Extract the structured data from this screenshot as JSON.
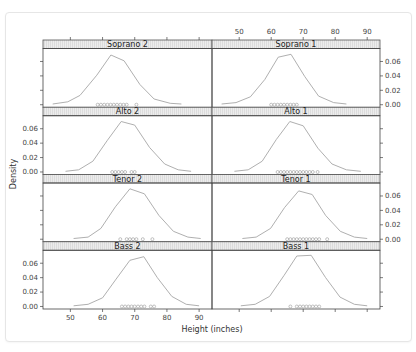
{
  "chart_data": {
    "type": "line",
    "subtype": "density-with-rug (lattice densityplot)",
    "title": "",
    "xlabel": "Height (inches)",
    "ylabel": "Density",
    "xlim": [
      41.5,
      94
    ],
    "ylim": [
      -0.0035,
      0.078
    ],
    "x_ticks": [
      50,
      60,
      70,
      80,
      90
    ],
    "y_ticks": [
      0.0,
      0.02,
      0.04,
      0.06
    ],
    "y_tick_labels": [
      "0.00",
      "0.02",
      "0.04",
      "0.06"
    ],
    "grid": false,
    "layout": {
      "columns": 2,
      "rows": 4
    },
    "panels": [
      {
        "name": "Soprano 2",
        "row": 0,
        "col": 0,
        "x": [
          44.5,
          49.2,
          53.0,
          58.2,
          62.6,
          66.7,
          71.6,
          76.0,
          81.0,
          84.5
        ],
        "y": [
          0.001,
          0.004,
          0.013,
          0.041,
          0.069,
          0.061,
          0.028,
          0.008,
          0.002,
          0.001
        ],
        "rug": [
          58.5,
          59.5,
          60.5,
          61.5,
          62.5,
          63.5,
          64.5,
          65.5,
          66.5,
          67.5,
          70.5
        ]
      },
      {
        "name": "Soprano 1",
        "row": 0,
        "col": 1,
        "x": [
          44.5,
          49.0,
          53.5,
          58.0,
          62.2,
          66.2,
          70.5,
          74.8,
          79.5,
          83.5
        ],
        "y": [
          0.001,
          0.003,
          0.011,
          0.035,
          0.066,
          0.07,
          0.039,
          0.012,
          0.003,
          0.001
        ],
        "rug": [
          60,
          61,
          62,
          63,
          64,
          65,
          66,
          67,
          68
        ]
      },
      {
        "name": "Alto 2",
        "row": 1,
        "col": 0,
        "x": [
          48.5,
          52.6,
          57.0,
          61.5,
          65.8,
          70.0,
          74.6,
          79.3,
          83.5,
          87.5
        ],
        "y": [
          0.001,
          0.003,
          0.015,
          0.044,
          0.07,
          0.065,
          0.034,
          0.011,
          0.003,
          0.001
        ],
        "rug": [
          63,
          64,
          65,
          66,
          67,
          69,
          70
        ]
      },
      {
        "name": "Alto 1",
        "row": 1,
        "col": 1,
        "x": [
          48.5,
          52.8,
          57.2,
          61.6,
          65.8,
          70.0,
          74.6,
          79.0,
          83.5,
          88.0
        ],
        "y": [
          0.001,
          0.003,
          0.015,
          0.045,
          0.07,
          0.064,
          0.033,
          0.011,
          0.003,
          0.001
        ],
        "rug": [
          62,
          63,
          64,
          65,
          66,
          67,
          68,
          69,
          70,
          71,
          72,
          73,
          74.5
        ]
      },
      {
        "name": "Tenor 2",
        "row": 2,
        "col": 0,
        "x": [
          51.0,
          55.5,
          59.5,
          64.0,
          68.5,
          73.0,
          77.5,
          82.0,
          86.5,
          90.5
        ],
        "y": [
          0.001,
          0.003,
          0.015,
          0.045,
          0.07,
          0.063,
          0.033,
          0.011,
          0.003,
          0.001
        ],
        "rug": [
          65.5,
          67.5,
          68.5,
          69.5,
          70.5,
          72.5,
          75.5
        ]
      },
      {
        "name": "Tenor 1",
        "row": 2,
        "col": 1,
        "x": [
          51.0,
          55.3,
          59.8,
          64.2,
          68.6,
          72.8,
          77.0,
          81.6,
          86.0,
          90.0
        ],
        "y": [
          0.001,
          0.003,
          0.015,
          0.044,
          0.067,
          0.062,
          0.033,
          0.011,
          0.003,
          0.001
        ],
        "rug": [
          65,
          66,
          67,
          68,
          69,
          70,
          71,
          72,
          73,
          74,
          75,
          77.5
        ]
      },
      {
        "name": "Bass 2",
        "row": 3,
        "col": 0,
        "x": [
          51.0,
          55.5,
          60.0,
          64.2,
          68.5,
          72.8,
          77.0,
          81.5,
          86.0,
          90.0
        ],
        "y": [
          0.001,
          0.003,
          0.012,
          0.038,
          0.064,
          0.069,
          0.04,
          0.014,
          0.003,
          0.001
        ],
        "rug": [
          66,
          67,
          68,
          69,
          70,
          71,
          72,
          73,
          75,
          76
        ]
      },
      {
        "name": "Bass 1",
        "row": 3,
        "col": 1,
        "x": [
          50.5,
          55.0,
          59.5,
          64.0,
          68.0,
          72.5,
          77.0,
          81.5,
          86.0,
          90.0
        ],
        "y": [
          0.001,
          0.003,
          0.014,
          0.043,
          0.07,
          0.071,
          0.04,
          0.013,
          0.003,
          0.001
        ],
        "rug": [
          66,
          68,
          69,
          70,
          71,
          72,
          73,
          74,
          75
        ]
      }
    ]
  },
  "colors": {
    "line": "#a6a6a6",
    "rug": "#999999",
    "strip_bg": "#e8e8e8",
    "strip_border": "#555555",
    "axis": "#444444",
    "panel_border": "#444444"
  }
}
